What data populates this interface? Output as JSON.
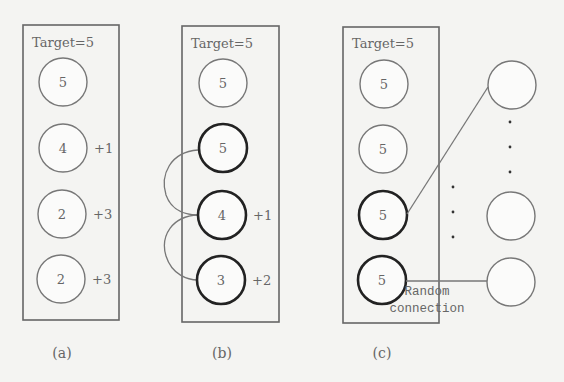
{
  "panels": [
    {
      "id": "a",
      "title": "Target=5",
      "caption": "(a)",
      "nodes": [
        {
          "value": "5",
          "delta": "",
          "bold": false
        },
        {
          "value": "4",
          "delta": "+1",
          "bold": false
        },
        {
          "value": "2",
          "delta": "+3",
          "bold": false
        },
        {
          "value": "2",
          "delta": "+3",
          "bold": false
        }
      ]
    },
    {
      "id": "b",
      "title": "Target=5",
      "caption": "(b)",
      "nodes": [
        {
          "value": "5",
          "delta": "",
          "bold": false
        },
        {
          "value": "5",
          "delta": "",
          "bold": true
        },
        {
          "value": "4",
          "delta": "+1",
          "bold": true
        },
        {
          "value": "3",
          "delta": "+2",
          "bold": true
        }
      ],
      "connections": "adjacent curved links between bold nodes"
    },
    {
      "id": "c",
      "title": "Target=5",
      "caption": "(c)",
      "nodes": [
        {
          "value": "5",
          "delta": "",
          "bold": false
        },
        {
          "value": "5",
          "delta": "",
          "bold": false
        },
        {
          "value": "5",
          "delta": "",
          "bold": true
        },
        {
          "value": "5",
          "delta": "",
          "bold": true
        }
      ],
      "external_nodes": 3,
      "ellipsis": "⋮",
      "connection_label_line1": "Random",
      "connection_label_line2": "connection"
    }
  ]
}
